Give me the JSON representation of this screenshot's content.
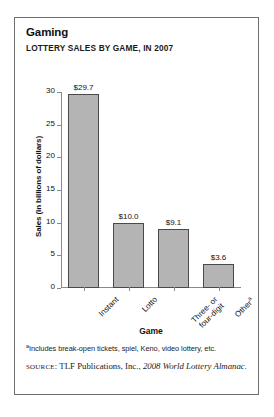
{
  "card": {
    "title": "Gaming",
    "subtitle": "LOTTERY SALES BY GAME, IN 2007"
  },
  "footnote": {
    "marker": "a",
    "text": "Includes break-open tickets, spiel, Keno, video lottery, etc."
  },
  "source": {
    "label": "SOURCE",
    "separator": ": ",
    "publisher": "TLF Publications, Inc., ",
    "work": "2008 World Lottery Almanac."
  },
  "colors": {
    "bar_fill": "#b4b4b4",
    "bar_stroke": "#4a4a4a",
    "axis": "#8a8a8a",
    "border": "#6e6e6e",
    "text": "#111111"
  },
  "chart_data": {
    "type": "bar",
    "title": "LOTTERY SALES BY GAME, IN 2007",
    "categories": [
      "Instant",
      "Lotto",
      "Three- or four-digit",
      "Other"
    ],
    "category_lines": [
      [
        "Instant"
      ],
      [
        "Lotto"
      ],
      [
        "Three- or",
        "four-digit"
      ],
      [
        "Other"
      ]
    ],
    "category_footnote_marks": [
      "",
      "",
      "",
      "a"
    ],
    "values": [
      29.7,
      10.0,
      9.1,
      3.6
    ],
    "value_labels": [
      "$29.7",
      "$10.0",
      "$9.1",
      "$3.6"
    ],
    "xlabel": "Game",
    "ylabel": "Sales (in billions of dollars)",
    "ylim": [
      0,
      30
    ],
    "yticks": [
      0,
      5,
      10,
      15,
      20,
      25,
      30
    ],
    "ytick_labels": [
      "0",
      "5",
      "10",
      "15",
      "20",
      "25",
      "30"
    ],
    "grid": false,
    "legend": false,
    "units": "billions of dollars",
    "year": 2007
  }
}
